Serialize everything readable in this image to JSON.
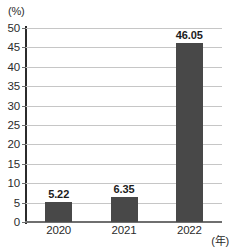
{
  "chart_data": {
    "type": "bar",
    "title": "",
    "subtitle": "",
    "xlabel": "(年)",
    "ylabel": "(%)",
    "categories": [
      "2020",
      "2021",
      "2022"
    ],
    "values": [
      5.22,
      6.35,
      46.05
    ],
    "value_labels": [
      "5.22",
      "6.35",
      "46.05"
    ],
    "ylim": [
      0,
      50
    ],
    "ytick_step": 5,
    "yticks": [
      0,
      5,
      10,
      15,
      20,
      25,
      30,
      35,
      40,
      45,
      50
    ],
    "ytick_labels": [
      "0",
      "5",
      "10",
      "15",
      "20",
      "25",
      "30",
      "35",
      "40",
      "45",
      "50"
    ],
    "grid": true,
    "legend": false,
    "legend_position": "none",
    "series": [
      {
        "name": "",
        "values": [
          5.22,
          6.35,
          46.05
        ]
      }
    ],
    "colors": {
      "bar": "#484848",
      "grid": "#c6c6c6",
      "axis": "#2b2b2b",
      "text": "#2b2b2b",
      "background": "#ffffff"
    }
  }
}
